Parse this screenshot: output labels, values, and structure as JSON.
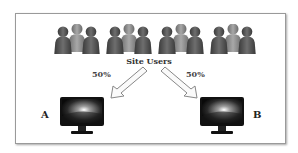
{
  "diagram": {
    "title": "Site Users",
    "split": [
      {
        "label": "50%",
        "variant": "A"
      },
      {
        "label": "50%",
        "variant": "B"
      }
    ],
    "user_groups": 4,
    "users_per_group": 3,
    "icons": {
      "users": "person-group-icon",
      "arrow": "hollow-arrow-icon",
      "variant": "monitor-icon"
    },
    "colors": {
      "frame_border": "#9a9a9a",
      "person_dark": "#4a4a4a",
      "person_light": "#8a8a8a",
      "monitor_body": "#111111"
    }
  }
}
